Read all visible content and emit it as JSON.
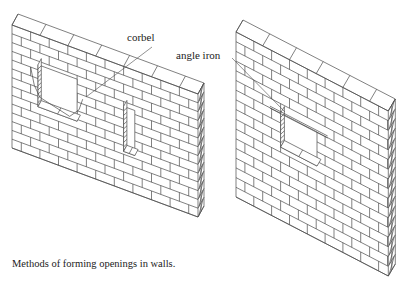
{
  "figure": {
    "caption": "Methods of forming openings in walls.",
    "labels": {
      "corbel": "corbel",
      "angle_iron": "angle iron"
    },
    "colors": {
      "ink": "#4a4a4a",
      "background": "#ffffff"
    },
    "walls": [
      {
        "id": "left-wall",
        "method": "corbel",
        "description": "brick wall with corbelled opening and a narrow rectangular window"
      },
      {
        "id": "right-wall",
        "method": "angle iron",
        "description": "brick wall with rectangular opening spanned by an angle iron lintel"
      }
    ]
  }
}
